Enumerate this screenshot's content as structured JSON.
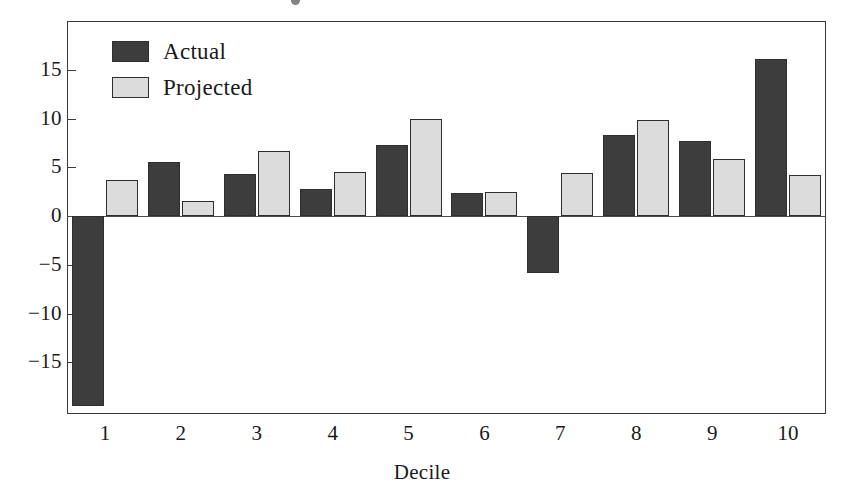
{
  "chart_data": {
    "type": "bar",
    "title": "",
    "subtitle": "",
    "xlabel": "Decile",
    "ylabel": "",
    "categories": [
      "1",
      "2",
      "3",
      "4",
      "5",
      "6",
      "7",
      "8",
      "9",
      "10"
    ],
    "series": [
      {
        "name": "Actual",
        "color": "#3d3d3d",
        "values": [
          -19.5,
          5.5,
          4.3,
          2.8,
          7.3,
          2.4,
          -5.8,
          8.3,
          7.7,
          16.1
        ]
      },
      {
        "name": "Projected",
        "color": "#dcdcdc",
        "values": [
          3.7,
          1.5,
          6.7,
          4.5,
          10.0,
          2.5,
          4.4,
          9.8,
          5.9,
          4.2
        ]
      }
    ],
    "ytick_labels": [
      "15",
      "10",
      "5",
      "0",
      "−5",
      "−10",
      "−15"
    ],
    "ytick_values": [
      15,
      10,
      5,
      0,
      -5,
      -10,
      -15
    ],
    "ylim": [
      -20.3,
      20.0
    ],
    "grid": false,
    "legend_position": "top-left",
    "legend_entries": [
      "Actual",
      "Projected"
    ],
    "frame": true
  },
  "axis": {
    "x_title": "Decile"
  },
  "legend": {
    "items": [
      {
        "label": "Actual",
        "swatch": "dark-square-swatch"
      },
      {
        "label": "Projected",
        "swatch": "light-square-swatch"
      }
    ]
  },
  "colors": {
    "actual": "#3d3d3d",
    "projected": "#dcdcdc",
    "frame": "#3a3a3a",
    "text": "#1a1a1a",
    "background": "#ffffff"
  }
}
